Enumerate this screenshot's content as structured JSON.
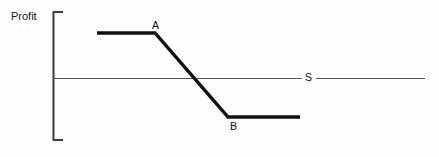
{
  "figure": {
    "background_color": "#fdfdfd",
    "line_color": "#111111",
    "axis_color": "#555555",
    "width": 439,
    "height": 157
  },
  "axis": {
    "y_label": "Profit",
    "bracket": {
      "x": 53,
      "top_y": 12,
      "bottom_y": 140,
      "foot_length": 10
    },
    "horizontal_line": {
      "y": 78,
      "x_start": 53,
      "x_end": 425,
      "gap_start": 302,
      "gap_end": 316
    }
  },
  "labels": {
    "point_a": "A",
    "point_b": "B",
    "line_s": "S"
  },
  "chart_data": {
    "type": "line",
    "title": "",
    "xlabel": "",
    "ylabel": "Profit",
    "grid": false,
    "legend": "none",
    "annotations": [
      {
        "text": "A",
        "x": 155,
        "y": 33,
        "placement": "above-right"
      },
      {
        "text": "B",
        "x": 228,
        "y": 117,
        "placement": "below-right"
      },
      {
        "text": "S",
        "x": 308,
        "y": 78,
        "placement": "inline-on-line"
      }
    ],
    "series": [
      {
        "name": "Profit curve",
        "style": "thick-solid",
        "color": "#111111",
        "points": [
          {
            "x": 97,
            "y": 33
          },
          {
            "x": 155,
            "y": 33
          },
          {
            "x": 228,
            "y": 117
          },
          {
            "x": 300,
            "y": 117
          }
        ]
      },
      {
        "name": "S",
        "style": "thin-solid",
        "color": "#555555",
        "points": [
          {
            "x": 53,
            "y": 78
          },
          {
            "x": 425,
            "y": 78
          }
        ]
      }
    ]
  }
}
